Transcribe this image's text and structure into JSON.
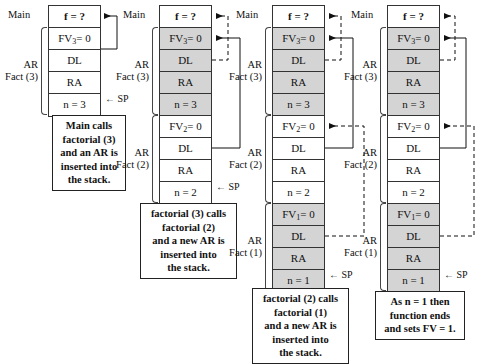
{
  "diagram": {
    "row_labels": {
      "top": "f = ?",
      "dl": "DL",
      "ra": "RA"
    },
    "sp_label": "← SP",
    "main_label": "Main",
    "ar_label": "AR",
    "colors": {
      "shaded_cell": "#d4d4d4",
      "cell_border": "#333333",
      "page_background": "#ffffff"
    },
    "columns": [
      {
        "id": "step-1",
        "main_label": "Main",
        "frames": [
          {
            "ar_label": "AR",
            "fact_label": "Fact (3)",
            "shaded": false,
            "cells": [
              {
                "text": "FV₃= 0",
                "fv_base": "FV",
                "fv_sub": "3",
                "fv_value": "0"
              },
              {
                "text": "DL"
              },
              {
                "text": "RA"
              },
              {
                "text": "n = 3",
                "sp": true
              }
            ]
          }
        ],
        "caption": "Main calls factorial (3) and an AR is inserted into the stack.",
        "caption_lines": [
          "Main calls",
          "factorial (3)",
          "and an AR is",
          "inserted into",
          "the stack."
        ]
      },
      {
        "id": "step-2",
        "main_label": "Main",
        "frames": [
          {
            "ar_label": "AR",
            "fact_label": "Fact (3)",
            "shaded": true,
            "cells": [
              {
                "text": "FV₃= 0",
                "fv_base": "FV",
                "fv_sub": "3",
                "fv_value": "0"
              },
              {
                "text": "DL"
              },
              {
                "text": "RA"
              },
              {
                "text": "n = 3"
              }
            ]
          },
          {
            "ar_label": "AR",
            "fact_label": "Fact (2)",
            "shaded": false,
            "cells": [
              {
                "text": "FV₂= 0",
                "fv_base": "FV",
                "fv_sub": "2",
                "fv_value": "0"
              },
              {
                "text": "DL"
              },
              {
                "text": "RA"
              },
              {
                "text": "n = 2",
                "sp": true
              }
            ]
          }
        ],
        "caption": "factorial (3) calls factorial (2) and a new AR is inserted into the stack.",
        "caption_lines": [
          "factorial (3) calls",
          "factorial (2)",
          "and a new AR is",
          "inserted into",
          "the stack."
        ]
      },
      {
        "id": "step-3",
        "main_label": "Main",
        "frames": [
          {
            "ar_label": "AR",
            "fact_label": "Fact (3)",
            "shaded": true,
            "cells": [
              {
                "text": "FV₃= 0",
                "fv_base": "FV",
                "fv_sub": "3",
                "fv_value": "0"
              },
              {
                "text": "DL"
              },
              {
                "text": "RA"
              },
              {
                "text": "n = 3"
              }
            ]
          },
          {
            "ar_label": "AR",
            "fact_label": "Fact (2)",
            "shaded": false,
            "cells": [
              {
                "text": "FV₂= 0",
                "fv_base": "FV",
                "fv_sub": "2",
                "fv_value": "0"
              },
              {
                "text": "DL"
              },
              {
                "text": "RA"
              },
              {
                "text": "n = 2"
              }
            ]
          },
          {
            "ar_label": "AR",
            "fact_label": "Fact (1)",
            "shaded": true,
            "cells": [
              {
                "text": "FV₁= 0",
                "fv_base": "FV",
                "fv_sub": "1",
                "fv_value": "0"
              },
              {
                "text": "DL"
              },
              {
                "text": "RA"
              },
              {
                "text": "n = 1",
                "sp": true
              }
            ]
          }
        ],
        "caption": "factorial (2) calls factorial (1) and a new AR is inserted into the stack.",
        "caption_lines": [
          "factorial (2) calls",
          "factorial (1)",
          "and a new AR is",
          "inserted into",
          "the stack."
        ]
      },
      {
        "id": "step-4",
        "main_label": "Main",
        "frames": [
          {
            "ar_label": "AR",
            "fact_label": "Fact (3)",
            "shaded": true,
            "cells": [
              {
                "text": "FV₃= 0",
                "fv_base": "FV",
                "fv_sub": "3",
                "fv_value": "0"
              },
              {
                "text": "DL"
              },
              {
                "text": "RA"
              },
              {
                "text": "n = 3"
              }
            ]
          },
          {
            "ar_label": "AR",
            "fact_label": "Fact (2)",
            "shaded": false,
            "cells": [
              {
                "text": "FV₂= 0",
                "fv_base": "FV",
                "fv_sub": "2",
                "fv_value": "0"
              },
              {
                "text": "DL"
              },
              {
                "text": "RA"
              },
              {
                "text": "n = 2"
              }
            ]
          },
          {
            "ar_label": "AR",
            "fact_label": "Fact (1)",
            "shaded": true,
            "cells": [
              {
                "text": "FV₁= 0",
                "fv_base": "FV",
                "fv_sub": "1",
                "fv_value": "0"
              },
              {
                "text": "DL"
              },
              {
                "text": "RA"
              },
              {
                "text": "n = 1",
                "sp": true
              }
            ]
          }
        ],
        "caption": "As n = 1 then function ends and sets FV = 1.",
        "caption_lines": [
          "As n = 1 then",
          "function ends",
          "and sets FV = 1."
        ]
      }
    ]
  }
}
